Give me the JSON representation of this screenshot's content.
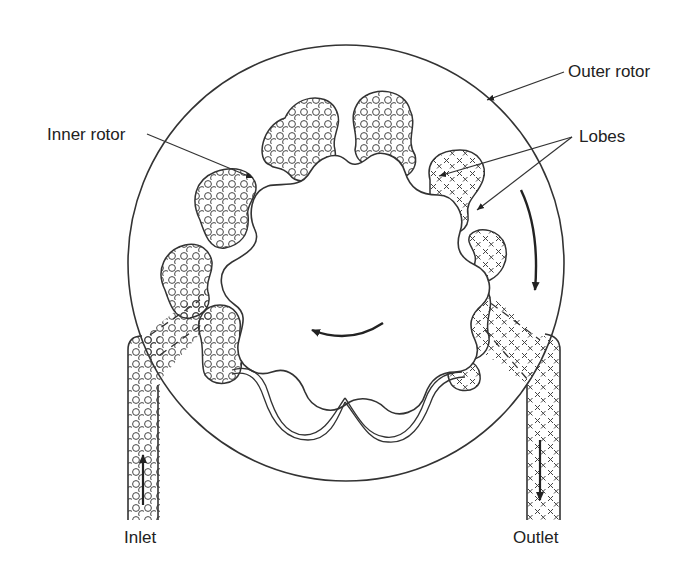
{
  "diagram": {
    "labels": {
      "outer_rotor": "Outer rotor",
      "inner_rotor": "Inner rotor",
      "lobes": "Lobes",
      "inlet": "Inlet",
      "outlet": "Outlet"
    },
    "symbols": {
      "inlet_fluid": "circle-pattern",
      "outlet_fluid": "x-pattern"
    },
    "colors": {
      "stroke": "#333333",
      "background": "#ffffff",
      "text": "#222222"
    },
    "components": [
      {
        "id": "outer-rotor",
        "shape": "circle"
      },
      {
        "id": "inner-rotor",
        "shape": "lobed-gear",
        "lobes": 9
      },
      {
        "id": "inlet-port",
        "flow": "up"
      },
      {
        "id": "outlet-port",
        "flow": "down"
      },
      {
        "id": "rotation-arrow-inner",
        "direction": "counter-clockwise"
      },
      {
        "id": "rotation-arrow-outer",
        "direction": "clockwise"
      }
    ]
  }
}
